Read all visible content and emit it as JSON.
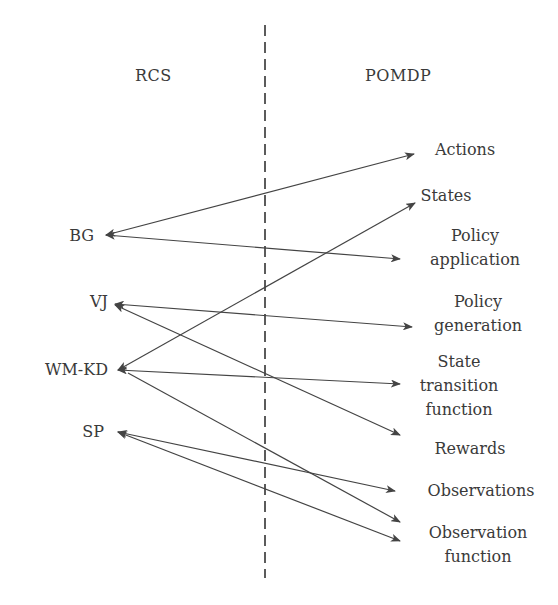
{
  "headers": {
    "left": "RCS",
    "right": "POMDP"
  },
  "rcs_components": [
    {
      "id": "BG",
      "label": "BG"
    },
    {
      "id": "VJ",
      "label": "VJ"
    },
    {
      "id": "WM-KD",
      "label": "WM-KD"
    },
    {
      "id": "SP",
      "label": "SP"
    }
  ],
  "pomdp_elements": [
    {
      "id": "actions",
      "lines": [
        "Actions"
      ]
    },
    {
      "id": "states",
      "lines": [
        "States"
      ]
    },
    {
      "id": "policy-application",
      "lines": [
        "Policy",
        "application"
      ]
    },
    {
      "id": "policy-generation",
      "lines": [
        "Policy",
        "generation"
      ]
    },
    {
      "id": "state-transition-function",
      "lines": [
        "State",
        "transition",
        "function"
      ]
    },
    {
      "id": "rewards",
      "lines": [
        "Rewards"
      ]
    },
    {
      "id": "observations",
      "lines": [
        "Observations"
      ]
    },
    {
      "id": "observation-function",
      "lines": [
        "Observation",
        "function"
      ]
    }
  ],
  "mappings": [
    {
      "from": "BG",
      "to": "Actions"
    },
    {
      "from": "BG",
      "to": "Policy application"
    },
    {
      "from": "VJ",
      "to": "Policy generation"
    },
    {
      "from": "VJ",
      "to": "Rewards"
    },
    {
      "from": "WM-KD",
      "to": "States"
    },
    {
      "from": "WM-KD",
      "to": "State transition function"
    },
    {
      "from": "WM-KD",
      "to": "Observation function"
    },
    {
      "from": "SP",
      "to": "Observations"
    },
    {
      "from": "SP",
      "to": "Observation function"
    }
  ],
  "colors": {
    "line": "#444444",
    "text": "#3a3a3a",
    "divider": "#333333"
  }
}
